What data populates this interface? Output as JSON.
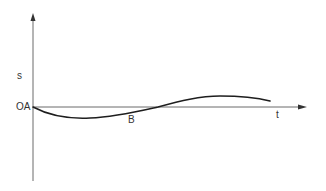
{
  "diagram": {
    "type": "displacement-time graph",
    "axes": {
      "y_label": "s",
      "x_label": "t",
      "origin_label": "OA"
    },
    "points": [
      {
        "label": "B",
        "description": "curve crosses time axis"
      }
    ],
    "colors": {
      "axis": "#6b6b6b",
      "curve": "#1e1e1e",
      "text": "#333333"
    }
  }
}
